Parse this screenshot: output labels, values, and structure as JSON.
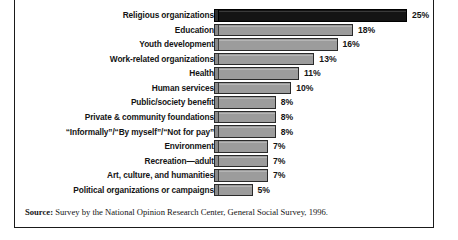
{
  "chart_data": {
    "type": "bar",
    "orientation": "horizontal",
    "title": "",
    "xlabel": "",
    "ylabel": "",
    "xlim": [
      0,
      25
    ],
    "grid": false,
    "legend": null,
    "value_suffix": "%",
    "highlight_index": 0,
    "categories": [
      "Religious organizations",
      "Education",
      "Youth development",
      "Work-related organizations",
      "Health",
      "Human services",
      "Public/society benefit",
      "Private & community foundations",
      "“Informally”/“By myself”/“Not for pay”",
      "Environment",
      "Recreation—adult",
      "Art, culture, and humanities",
      "Political organizations or campaigns"
    ],
    "values": [
      25,
      18,
      16,
      13,
      11,
      10,
      8,
      8,
      8,
      7,
      7,
      7,
      5
    ],
    "value_labels": [
      "25%",
      "18%",
      "16%",
      "13%",
      "11%",
      "10%",
      "8%",
      "8%",
      "8%",
      "7%",
      "7%",
      "7%",
      "5%"
    ],
    "colors": {
      "bar_fill": "#9c9c9c",
      "bar_highlight_fill": "#141414",
      "bar_outline": "#2a2a2a",
      "text": "#141414",
      "frame": "#1a1a1a",
      "background": "#ffffff"
    }
  },
  "source": {
    "label": "Source:",
    "text": " Survey by the National Opinion Research Center, General Social Survey, 1996."
  }
}
